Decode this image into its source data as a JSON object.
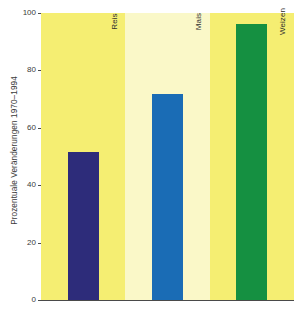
{
  "chart_data": {
    "type": "bar",
    "title": "",
    "xlabel": "",
    "ylabel": "Prozentuale Veränderungen 1970–1994",
    "categories": [
      "Reis",
      "Mais",
      "Weizen"
    ],
    "values": [
      52,
      72,
      96.5
    ],
    "series": [
      {
        "name": "Prozentuale Veränderungen 1970–1994",
        "values": [
          52,
          72,
          96.5
        ]
      }
    ],
    "ylim": [
      0,
      100
    ],
    "yticks": [
      0,
      20,
      40,
      60,
      80,
      100
    ],
    "ytick_labels": [
      "0",
      "20",
      "40",
      "60",
      "80",
      "100"
    ],
    "grid": false,
    "legend": false,
    "bar_colors": [
      "#2d2c7a",
      "#1a6cb5",
      "#159041"
    ],
    "band_colors": [
      "#f5ee72",
      "#faf8c8",
      "#f5ee72"
    ],
    "background": "#ffffff",
    "axis_color": "#4a4a4a"
  },
  "axis": {
    "y_title": "Prozentuale Veränderungen 1970–1994",
    "ticks": [
      {
        "label": "100",
        "value": 100
      },
      {
        "label": "80",
        "value": 80
      },
      {
        "label": "60",
        "value": 60
      },
      {
        "label": "40",
        "value": 40
      },
      {
        "label": "20",
        "value": 20
      },
      {
        "label": "0",
        "value": 0
      }
    ]
  },
  "bars": [
    {
      "label": "Reis",
      "value": 52,
      "color": "#2d2c7a",
      "band": "#f5ee72"
    },
    {
      "label": "Mais",
      "value": 72,
      "color": "#1a6cb5",
      "band": "#faf8c8"
    },
    {
      "label": "Weizen",
      "value": 96.5,
      "color": "#159041",
      "band": "#f5ee72"
    }
  ]
}
